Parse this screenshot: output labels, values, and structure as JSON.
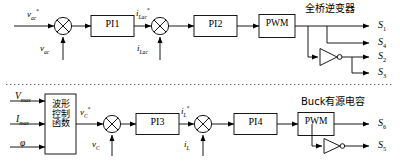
{
  "figure": {
    "type": "control-block-diagram",
    "divider": "dotted-horizontal-separator"
  },
  "top_loop": {
    "name": "full-bridge-inverter-control-loop",
    "section_title": "全桥逆变器",
    "inputs": {
      "reference": {
        "symbol": "v",
        "sub": "ac",
        "sup": "*"
      },
      "feedback": {
        "symbol": "v",
        "sub": "ac",
        "sup": ""
      }
    },
    "blocks": [
      {
        "id": "pi1",
        "label": "PI1"
      },
      {
        "id": "pi2",
        "label": "PI2"
      },
      {
        "id": "pwm1",
        "label": "PWM"
      }
    ],
    "mid_signals": {
      "current_ref": {
        "symbol": "i",
        "sub": "Lac",
        "sup": "*"
      },
      "current_fb": {
        "symbol": "i",
        "sub": "Lac",
        "sup": ""
      }
    },
    "summing_junctions": [
      {
        "id": "sum1",
        "glyph": "x-circle"
      },
      {
        "id": "sum2",
        "glyph": "x-circle"
      }
    ],
    "not_gate": {
      "id": "not1",
      "label": "not-gate"
    },
    "outputs": [
      {
        "symbol": "S",
        "sub": "1"
      },
      {
        "symbol": "S",
        "sub": "4"
      },
      {
        "symbol": "S",
        "sub": "2"
      },
      {
        "symbol": "S",
        "sub": "3"
      }
    ]
  },
  "bottom_loop": {
    "name": "buck-active-capacitor-control-loop",
    "section_title": "Buck有源电容",
    "inputs": [
      {
        "symbol": "V",
        "sub": "max",
        "sup": ""
      },
      {
        "symbol": "I",
        "sub": "max",
        "sup": ""
      },
      {
        "symbol": "φ",
        "sub": "",
        "sup": ""
      }
    ],
    "blocks": [
      {
        "id": "waveform",
        "label": "波形\n控制\n函数",
        "lines": [
          "波形",
          "控制",
          "函数"
        ]
      },
      {
        "id": "pi3",
        "label": "PI3"
      },
      {
        "id": "pi4",
        "label": "PI4"
      },
      {
        "id": "pwm2",
        "label": "PWM"
      }
    ],
    "mid_signals": {
      "voltage_ref": {
        "symbol": "v",
        "sub": "C",
        "sup": "*"
      },
      "voltage_fb": {
        "symbol": "v",
        "sub": "C",
        "sup": ""
      },
      "current_ref": {
        "symbol": "i",
        "sub": "L",
        "sup": "*"
      },
      "current_fb": {
        "symbol": "i",
        "sub": "L",
        "sup": ""
      }
    },
    "summing_junctions": [
      {
        "id": "sum3",
        "glyph": "x-circle"
      },
      {
        "id": "sum4",
        "glyph": "x-circle"
      }
    ],
    "not_gate": {
      "id": "not2",
      "label": "not-gate"
    },
    "outputs": [
      {
        "symbol": "S",
        "sub": "6"
      },
      {
        "symbol": "S",
        "sub": "5"
      }
    ]
  },
  "colors": {
    "line": "#000000",
    "box_fill": "#ffffff",
    "box_stroke": "#000000",
    "background": "#ffffff"
  }
}
